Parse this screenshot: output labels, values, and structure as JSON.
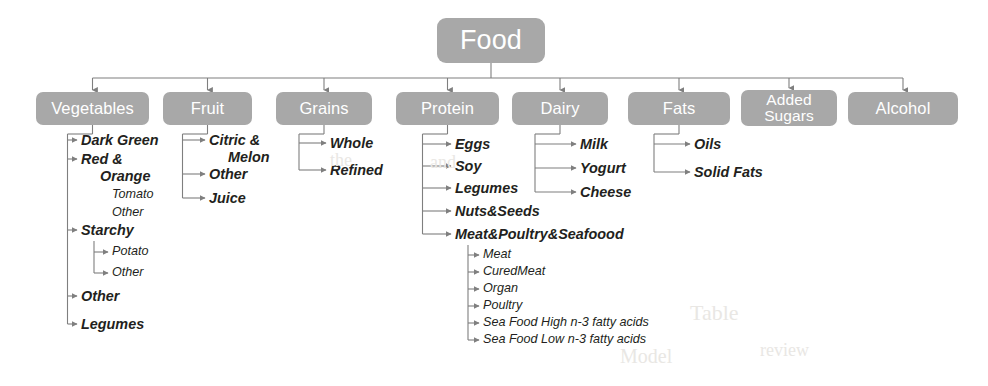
{
  "diagram": {
    "root": {
      "label": "Food",
      "x": 437,
      "y": 18,
      "w": 108,
      "h": 45
    },
    "style": {
      "node_fill": "#a8a8a8",
      "node_text": "#ffffff",
      "leaf_text": "#231f20",
      "wire_color": "#7f7f7f",
      "background": "#ffffff"
    },
    "categories": [
      {
        "label": "Vegetables",
        "x": 36,
        "y": 92,
        "w": 113,
        "h": 33,
        "two_line": false
      },
      {
        "label": "Fruit",
        "x": 163,
        "y": 92,
        "w": 89,
        "h": 33,
        "two_line": false
      },
      {
        "label": "Grains",
        "x": 276,
        "y": 92,
        "w": 96,
        "h": 33,
        "two_line": false
      },
      {
        "label": "Protein",
        "x": 396,
        "y": 92,
        "w": 103,
        "h": 33,
        "two_line": false
      },
      {
        "label": "Dairy",
        "x": 512,
        "y": 92,
        "w": 96,
        "h": 33,
        "two_line": false
      },
      {
        "label": "Fats",
        "x": 628,
        "y": 92,
        "w": 102,
        "h": 33,
        "two_line": false
      },
      {
        "label": "Added\nSugars",
        "x": 741,
        "y": 90,
        "w": 96,
        "h": 36,
        "two_line": true
      },
      {
        "label": "Alcohol",
        "x": 848,
        "y": 92,
        "w": 110,
        "h": 33,
        "two_line": false
      }
    ],
    "leaves": [
      {
        "text": "Dark Green",
        "level": 2,
        "x": 81,
        "y": 144,
        "parent": "Vegetables"
      },
      {
        "text": "Red &",
        "level": 2,
        "x": 81,
        "y": 163,
        "parent": "Vegetables"
      },
      {
        "text": "Orange",
        "level": 2,
        "x": 100,
        "y": 180,
        "parent": "Vegetables"
      },
      {
        "text": "Tomato",
        "level": 3,
        "x": 112,
        "y": 199,
        "parent": "Red & Orange"
      },
      {
        "text": "Other",
        "level": 3,
        "x": 112,
        "y": 217,
        "parent": "Red & Orange"
      },
      {
        "text": "Starchy",
        "level": 2,
        "x": 81,
        "y": 234,
        "parent": "Vegetables"
      },
      {
        "text": "Potato",
        "level": 3,
        "x": 112,
        "y": 256,
        "parent": "Starchy"
      },
      {
        "text": "Other",
        "level": 3,
        "x": 112,
        "y": 277,
        "parent": "Starchy"
      },
      {
        "text": "Other",
        "level": 2,
        "x": 81,
        "y": 300,
        "parent": "Vegetables"
      },
      {
        "text": "Legumes",
        "level": 2,
        "x": 81,
        "y": 328,
        "parent": "Vegetables"
      },
      {
        "text": "Citric &",
        "level": 2,
        "x": 209,
        "y": 144,
        "parent": "Fruit"
      },
      {
        "text": "Melon",
        "level": 2,
        "x": 228,
        "y": 161,
        "parent": "Fruit"
      },
      {
        "text": "Other",
        "level": 2,
        "x": 209,
        "y": 178,
        "parent": "Fruit"
      },
      {
        "text": "Juice",
        "level": 2,
        "x": 209,
        "y": 202,
        "parent": "Fruit"
      },
      {
        "text": "Whole",
        "level": 2,
        "x": 330,
        "y": 147,
        "parent": "Grains"
      },
      {
        "text": "Refined",
        "level": 2,
        "x": 330,
        "y": 174,
        "parent": "Grains"
      },
      {
        "text": "Eggs",
        "level": 2,
        "x": 455,
        "y": 148,
        "parent": "Protein"
      },
      {
        "text": "Soy",
        "level": 2,
        "x": 455,
        "y": 170,
        "parent": "Protein"
      },
      {
        "text": "Legumes",
        "level": 2,
        "x": 455,
        "y": 192,
        "parent": "Protein"
      },
      {
        "text": "Nuts&Seeds",
        "level": 2,
        "x": 455,
        "y": 215,
        "parent": "Protein"
      },
      {
        "text": "Meat&Poultry&Seafoood",
        "level": 2,
        "x": 455,
        "y": 238,
        "parent": "Protein"
      },
      {
        "text": "Meat",
        "level": 3,
        "x": 483,
        "y": 259,
        "parent": "Meat&Poultry&Seafoood"
      },
      {
        "text": "CuredMeat",
        "level": 3,
        "x": 483,
        "y": 276,
        "parent": "Meat&Poultry&Seafoood"
      },
      {
        "text": "Organ",
        "level": 3,
        "x": 483,
        "y": 293,
        "parent": "Meat&Poultry&Seafoood"
      },
      {
        "text": "Poultry",
        "level": 3,
        "x": 483,
        "y": 310,
        "parent": "Meat&Poultry&Seafoood"
      },
      {
        "text": "Sea Food High n-3 fatty acids",
        "level": 3,
        "x": 483,
        "y": 327,
        "parent": "Meat&Poultry&Seafoood"
      },
      {
        "text": "Sea Food Low n-3 fatty acids",
        "level": 3,
        "x": 483,
        "y": 344,
        "parent": "Meat&Poultry&Seafoood"
      },
      {
        "text": "Milk",
        "level": 2,
        "x": 580,
        "y": 148,
        "parent": "Dairy"
      },
      {
        "text": "Yogurt",
        "level": 2,
        "x": 580,
        "y": 172,
        "parent": "Dairy"
      },
      {
        "text": "Cheese",
        "level": 2,
        "x": 580,
        "y": 196,
        "parent": "Dairy"
      },
      {
        "text": "Oils",
        "level": 2,
        "x": 694,
        "y": 148,
        "parent": "Fats"
      },
      {
        "text": "Solid Fats",
        "level": 2,
        "x": 694,
        "y": 176,
        "parent": "Fats"
      }
    ],
    "bleed_text": [
      {
        "text": "Table",
        "x": 690,
        "y": 300,
        "size": 22
      },
      {
        "text": "the",
        "x": 330,
        "y": 150,
        "size": 18
      },
      {
        "text": "and",
        "x": 430,
        "y": 152,
        "size": 18
      },
      {
        "text": "review",
        "x": 760,
        "y": 340,
        "size": 18
      },
      {
        "text": "Model",
        "x": 620,
        "y": 345,
        "size": 20
      }
    ]
  }
}
